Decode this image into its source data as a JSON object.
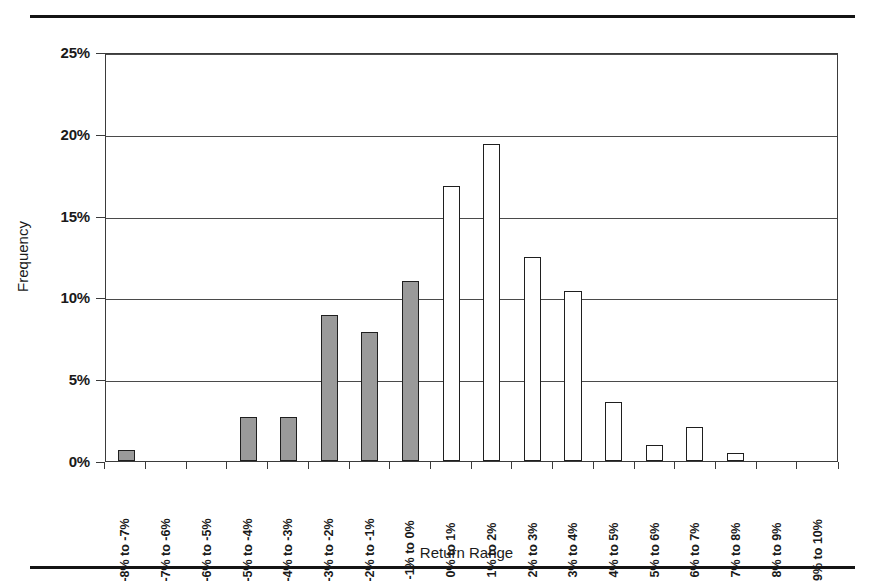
{
  "figure": {
    "rule_top": "horizontal-rule",
    "rule_bottom": "horizontal-rule"
  },
  "chart_data": {
    "type": "bar",
    "title": "",
    "xlabel": "Return Range",
    "ylabel": "Frequency",
    "ylim": [
      0,
      25
    ],
    "ytick_labels": [
      "25%",
      "20%",
      "15%",
      "10%",
      "5%",
      "0%"
    ],
    "ytick_values": [
      25,
      20,
      15,
      10,
      5,
      0
    ],
    "grid": true,
    "legend": "none",
    "categories": [
      "-8% to -7%",
      "-7% to -6%",
      "-6% to -5%",
      "-5% to -4%",
      "-4% to -3%",
      "-3% to -2%",
      "-2% to -1%",
      "-1% to 0%",
      "0% to 1%",
      "1% to 2%",
      "2% to 3%",
      "3% to 4%",
      "4% to 5%",
      "5% to 6%",
      "6% to 7%",
      "7% to 8%",
      "8% to 9%",
      "9% to 10%"
    ],
    "values": [
      0.7,
      0.0,
      0.0,
      2.7,
      2.7,
      8.9,
      7.9,
      11.0,
      16.8,
      19.4,
      12.5,
      10.4,
      3.6,
      1.0,
      2.1,
      0.5,
      0.0,
      0.0
    ],
    "bar_styles": [
      "filled",
      "filled",
      "filled",
      "filled",
      "filled",
      "filled",
      "filled",
      "filled",
      "open",
      "open",
      "open",
      "open",
      "open",
      "open",
      "open",
      "open",
      "open",
      "open"
    ],
    "colors": {
      "bar_filled": "#9a9a9a",
      "bar_open": "#ffffff",
      "bar_edge": "#1f1f1f",
      "gridline": "#4a4a4a",
      "axis": "#3b3b3b",
      "text": "#1a1a1a",
      "rule": "#141414"
    }
  }
}
